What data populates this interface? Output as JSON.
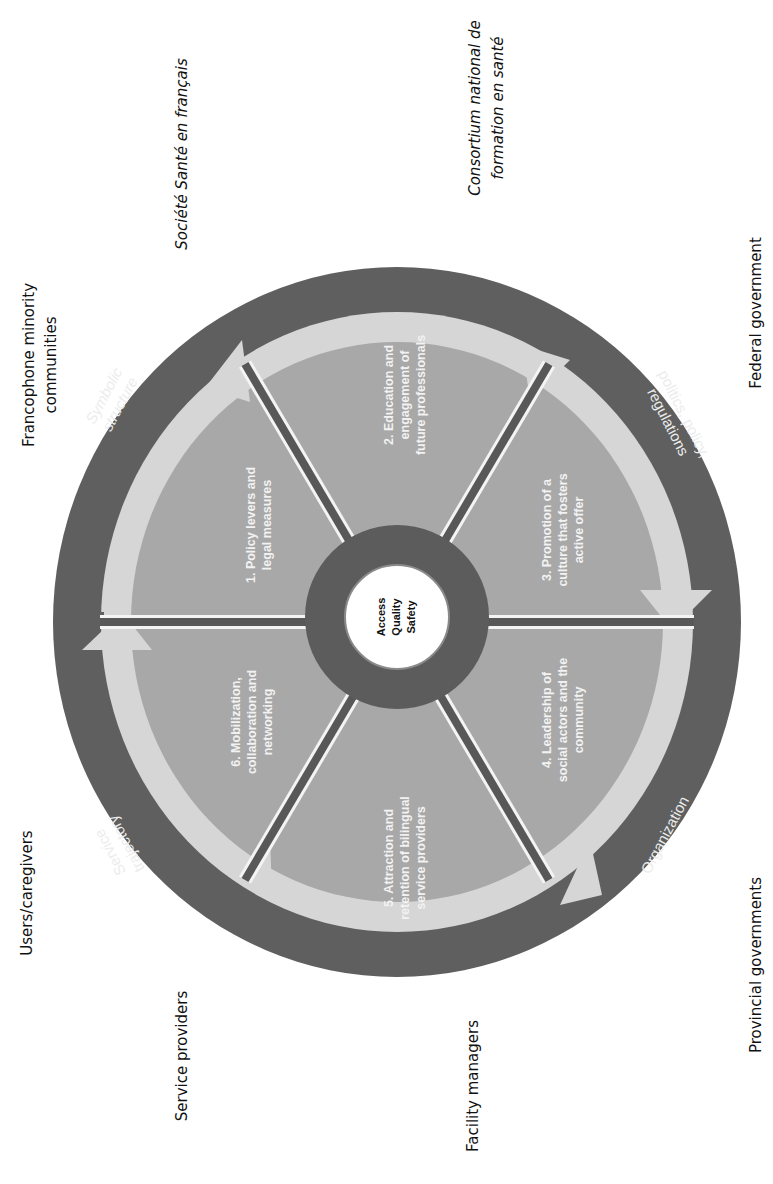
{
  "diagram": {
    "colors": {
      "outer_ring": "#5f5f5f",
      "arrow_band": "#d6d6d6",
      "segment_fill": "#a8a8a8",
      "divider": "#585858",
      "divider_edge": "#f4f4f4",
      "hub_ring": "#5c5c5c",
      "hub_center": "#ffffff",
      "background": "#ffffff"
    },
    "center": {
      "lines": [
        "Access",
        "Quality",
        "Safety"
      ]
    },
    "segments": [
      {
        "lines": [
          "1. Policy levers and",
          "legal measures"
        ]
      },
      {
        "lines": [
          "2. Education and",
          "engagement of",
          "future professionals"
        ]
      },
      {
        "lines": [
          "3. Promotion of a",
          "culture that fosters",
          "active offer"
        ]
      },
      {
        "lines": [
          "4. Leadership of",
          "social actors and the",
          "community"
        ]
      },
      {
        "lines": [
          "5. Attraction and",
          "retention of bilingual",
          "service providers"
        ]
      },
      {
        "lines": [
          "6. Mobilization,",
          "collaboration and",
          "networking"
        ]
      }
    ],
    "ring_labels": {
      "symbolic": [
        "Symbolic",
        "structure"
      ],
      "politics": [
        "politics, policy,",
        "regulations"
      ],
      "organization": [
        "Organization"
      ],
      "service": [
        "Service",
        "trajectory"
      ]
    },
    "stakeholders": {
      "francophone": [
        "Francophone minority",
        "communities"
      ],
      "societe": [
        "Société Santé en français"
      ],
      "consortium": [
        "Consortium national de",
        "formation en santé"
      ],
      "federal": [
        "Federal government"
      ],
      "users": [
        "Users/caregivers"
      ],
      "service_providers": [
        "Service providers"
      ],
      "facility_managers": [
        "Facility managers"
      ],
      "provincial": [
        "Provincial governments"
      ]
    }
  }
}
